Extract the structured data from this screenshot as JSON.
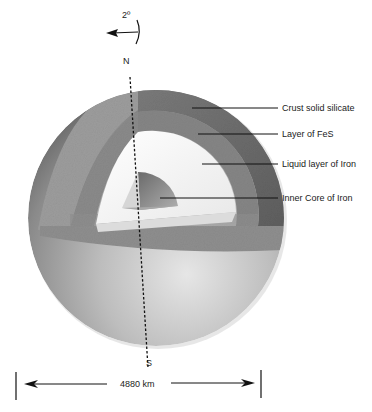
{
  "diagram": {
    "rotation": {
      "label": "2º",
      "direction": "counter-clockwise"
    },
    "poles": {
      "north": "N",
      "south": "S"
    },
    "layers": [
      {
        "id": "crust",
        "label": "Crust solid silicate",
        "color": "#6a6a6a"
      },
      {
        "id": "fes",
        "label": "Layer of FeS",
        "color": "#8a8a8a"
      },
      {
        "id": "liquid",
        "label": "Liquid layer of Iron",
        "color": "#f2f2f2"
      },
      {
        "id": "inner",
        "label": "Inner Core of Iron",
        "color": "#7c7c7c"
      }
    ],
    "dimension": {
      "label": "4880 km"
    }
  }
}
